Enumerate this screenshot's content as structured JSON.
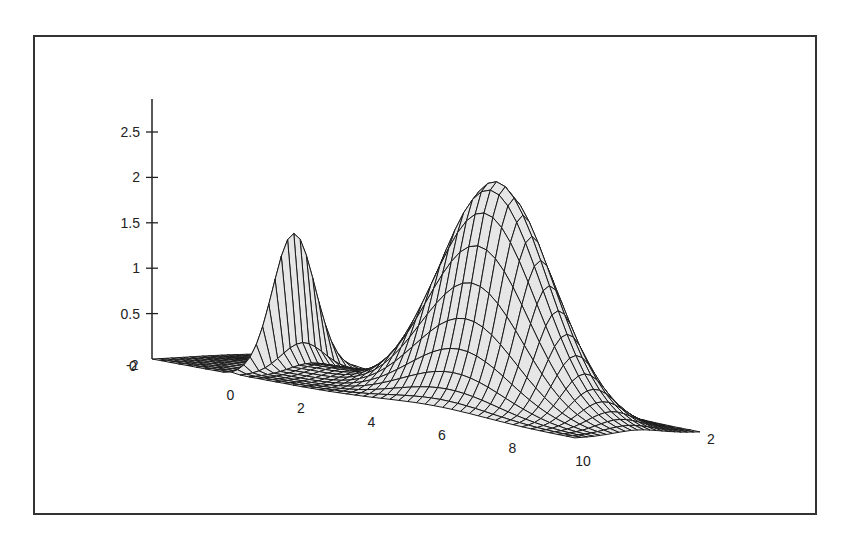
{
  "chart_data": {
    "type": "surface3d",
    "title": "",
    "xlabel": "",
    "ylabel": "",
    "zlabel": "",
    "x_ticks": [
      "0",
      "2",
      "4",
      "6",
      "8",
      "10"
    ],
    "x_range": [
      -2,
      10
    ],
    "y_ticks": [
      "-2",
      "2"
    ],
    "y_range": [
      -2,
      2
    ],
    "z_ticks": [
      "0",
      "0.5",
      "1",
      "1.5",
      "2",
      "2.5"
    ],
    "z_range": [
      0,
      2.5
    ],
    "origin_labels": [
      "-2",
      "0"
    ],
    "grid": false,
    "legend": null,
    "features": [
      {
        "name": "spike",
        "x": 0.3,
        "y": 0,
        "peak_z": 1.6
      },
      {
        "name": "hump",
        "x": 6,
        "y": 0,
        "peak_z": 2.5
      }
    ],
    "colors": {
      "surface_fill": "#e6e6e6",
      "mesh_line": "#1a1a1a",
      "axis": "#222222",
      "frame": "#333333",
      "background": "#ffffff"
    }
  }
}
